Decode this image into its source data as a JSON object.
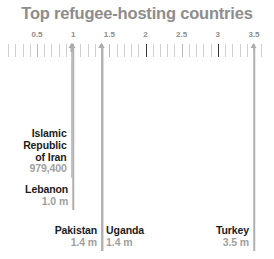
{
  "title": "Top refugee-hosting countries",
  "axis": {
    "unit": "millions",
    "min": 0.1,
    "max": 3.6,
    "tick_step": 0.1,
    "labels": [
      {
        "value": 0.5,
        "text": "0.5"
      },
      {
        "value": 1.0,
        "text": "1"
      },
      {
        "value": 1.5,
        "text": "1.5"
      },
      {
        "value": 2.0,
        "text": "2"
      },
      {
        "value": 2.5,
        "text": "2.5"
      },
      {
        "value": 3.0,
        "text": "3"
      },
      {
        "value": 3.5,
        "text": "3.5"
      }
    ],
    "dark_ticks": [
      2.0,
      3.0
    ]
  },
  "countries": [
    {
      "name": "Islamic\nRepublic\nof Iran",
      "name_lines": [
        "Islamic",
        "Republic",
        "of Iran"
      ],
      "value_text": "979,400",
      "value": 0.9794,
      "side": "right",
      "label_top": 128
    },
    {
      "name": "Lebanon",
      "name_lines": [
        "Lebanon"
      ],
      "value_text": "1.0 m",
      "value": 1.0,
      "side": "right",
      "label_top": 184
    },
    {
      "name": "Pakistan",
      "name_lines": [
        "Pakistan"
      ],
      "value_text": "1.4 m",
      "value": 1.4,
      "side": "right",
      "label_top": 225
    },
    {
      "name": "Uganda",
      "name_lines": [
        "Uganda"
      ],
      "value_text": "1.4 m",
      "value": 1.4,
      "side": "left",
      "label_top": 225
    },
    {
      "name": "Turkey",
      "name_lines": [
        "Turkey"
      ],
      "value_text": "3.5 m",
      "value": 3.5,
      "side": "right",
      "label_top": 225
    }
  ],
  "chart_data": {
    "type": "bar",
    "orientation": "vertical-rule",
    "title": "Top refugee-hosting countries",
    "xlabel": "",
    "ylabel": "",
    "unit": "millions of refugees",
    "categories": [
      "Islamic Republic of Iran",
      "Lebanon",
      "Pakistan",
      "Uganda",
      "Turkey"
    ],
    "values": [
      0.9794,
      1.0,
      1.4,
      1.4,
      3.5
    ],
    "value_labels": [
      "979,400",
      "1.0 m",
      "1.4 m",
      "1.4 m",
      "3.5 m"
    ],
    "xlim": [
      0.1,
      3.6
    ],
    "xticks": [
      0.5,
      1.0,
      1.5,
      2.0,
      2.5,
      3.0,
      3.5
    ],
    "xticklabels": [
      "0.5",
      "1",
      "1.5",
      "2",
      "2.5",
      "3",
      "3.5"
    ],
    "minor_tick_step": 0.1,
    "grid": false,
    "legend": "none"
  },
  "colors": {
    "background": "#ffffff",
    "title": "#8d8d8d",
    "tick": "#cfcfcf",
    "tick_dark": "#3a3a3a",
    "line": "#b0b0b0",
    "label_name": "#1b1b1b",
    "label_value": "#a0a0a0"
  }
}
